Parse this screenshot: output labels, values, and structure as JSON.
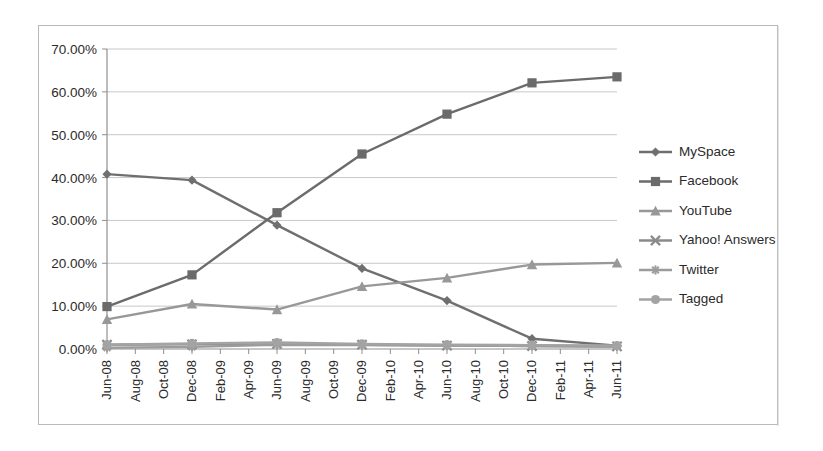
{
  "chart_data": {
    "type": "line",
    "title": "",
    "subtitle": "",
    "xlabel": "",
    "ylabel": "",
    "grid": true,
    "legend_position": "right",
    "ylim": [
      0,
      70
    ],
    "ytick_labels": [
      "70.00%",
      "60.00%",
      "50.00%",
      "40.00%",
      "30.00%",
      "20.00%",
      "10.00%",
      "0.00%"
    ],
    "ytick_values": [
      70,
      60,
      50,
      40,
      30,
      20,
      10,
      0
    ],
    "categories": [
      "Jun-08",
      "Aug-08",
      "Oct-08",
      "Dec-08",
      "Feb-09",
      "Apr-09",
      "Jun-09",
      "Aug-09",
      "Oct-09",
      "Dec-09",
      "Feb-10",
      "Apr-10",
      "Jun-10",
      "Aug-10",
      "Oct-10",
      "Dec-10",
      "Feb-11",
      "Apr-11",
      "Jun-11"
    ],
    "marker_categories": [
      "Jun-08",
      "Dec-08",
      "Jun-09",
      "Dec-09",
      "Jun-10",
      "Dec-10",
      "Jun-11"
    ],
    "series": [
      {
        "name": "MySpace",
        "marker": "diamond",
        "color": "#6f6f6f",
        "x": [
          "Jun-08",
          "Dec-08",
          "Jun-09",
          "Dec-09",
          "Jun-10",
          "Dec-10",
          "Jun-11"
        ],
        "values": [
          40.8,
          39.4,
          28.9,
          18.8,
          11.3,
          2.4,
          0.8
        ]
      },
      {
        "name": "Facebook",
        "marker": "square",
        "color": "#6b6b6b",
        "x": [
          "Jun-08",
          "Dec-08",
          "Jun-09",
          "Dec-09",
          "Jun-10",
          "Dec-10",
          "Jun-11"
        ],
        "values": [
          9.9,
          17.3,
          31.8,
          45.5,
          54.8,
          62.1,
          63.5
        ]
      },
      {
        "name": "YouTube",
        "marker": "triangle",
        "color": "#989898",
        "x": [
          "Jun-08",
          "Dec-08",
          "Jun-09",
          "Dec-09",
          "Jun-10",
          "Dec-10",
          "Jun-11"
        ],
        "values": [
          6.9,
          10.5,
          9.2,
          14.6,
          16.6,
          19.7,
          20.1
        ]
      },
      {
        "name": "Yahoo! Answers",
        "marker": "cross",
        "color": "#8a8a8a",
        "x": [
          "Jun-08",
          "Dec-08",
          "Jun-09",
          "Dec-09",
          "Jun-10",
          "Dec-10",
          "Jun-11"
        ],
        "values": [
          1.0,
          1.1,
          1.2,
          1.0,
          0.8,
          0.7,
          0.6
        ]
      },
      {
        "name": "Twitter",
        "marker": "star",
        "color": "#9c9c9c",
        "x": [
          "Jun-08",
          "Dec-08",
          "Jun-09",
          "Dec-09",
          "Jun-10",
          "Dec-10",
          "Jun-11"
        ],
        "values": [
          0.3,
          0.5,
          1.0,
          0.9,
          0.8,
          0.7,
          0.6
        ]
      },
      {
        "name": "Tagged",
        "marker": "circle",
        "color": "#a3a3a3",
        "x": [
          "Jun-08",
          "Dec-08",
          "Jun-09",
          "Dec-09",
          "Jun-10",
          "Dec-10",
          "Jun-11"
        ],
        "values": [
          1.0,
          1.3,
          1.5,
          1.2,
          1.0,
          0.9,
          0.8
        ]
      }
    ]
  },
  "legend": {
    "items": [
      {
        "label": "MySpace"
      },
      {
        "label": "Facebook"
      },
      {
        "label": "YouTube"
      },
      {
        "label": "Yahoo! Answers"
      },
      {
        "label": "Twitter"
      },
      {
        "label": "Tagged"
      }
    ]
  }
}
